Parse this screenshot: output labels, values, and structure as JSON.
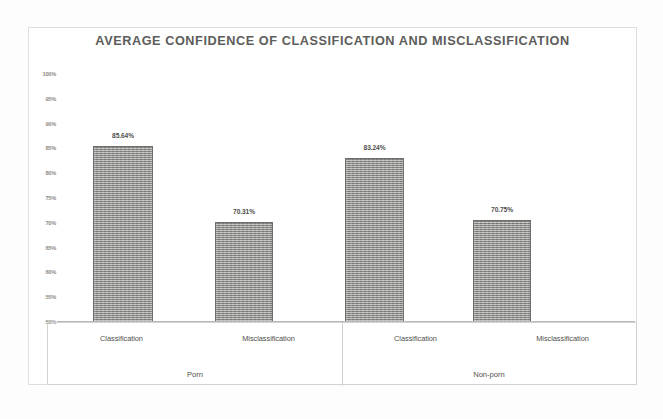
{
  "chart_data": {
    "type": "bar",
    "title": "AVERAGE CONFIDENCE OF CLASSIFICATION AND MISCLASSIFICATION",
    "xlabel": "",
    "ylabel": "",
    "ylim": [
      50,
      100
    ],
    "grid": false,
    "legend": "none",
    "y_tick_labels": [
      "100%",
      "95%",
      "90%",
      "85%",
      "80%",
      "75%",
      "70%",
      "65%",
      "60%",
      "55%",
      "50%"
    ],
    "y_tick_values": [
      100,
      95,
      90,
      85,
      80,
      75,
      70,
      65,
      60,
      55,
      50
    ],
    "groups": [
      "Porn",
      "Non-porn"
    ],
    "categories": [
      "Classification",
      "Misclassification",
      "Classification",
      "Misclassification"
    ],
    "values": [
      85.64,
      70.31,
      83.24,
      70.75
    ],
    "data_labels": [
      "85.64%",
      "70.31%",
      "83.24%",
      "70.75%"
    ],
    "bar_color": "#9a9a97",
    "bar_border_color": "#6e6e6b",
    "title_color": "#5d5d5b",
    "series": [
      {
        "name": "Average confidence",
        "points": [
          {
            "group": "Porn",
            "category": "Classification",
            "value": 85.64,
            "label": "85.64%"
          },
          {
            "group": "Porn",
            "category": "Misclassification",
            "value": 70.31,
            "label": "70.31%"
          },
          {
            "group": "Non-porn",
            "category": "Classification",
            "value": 83.24,
            "label": "83.24%"
          },
          {
            "group": "Non-porn",
            "category": "Misclassification",
            "value": 70.75,
            "label": "70.75%"
          }
        ]
      }
    ]
  }
}
